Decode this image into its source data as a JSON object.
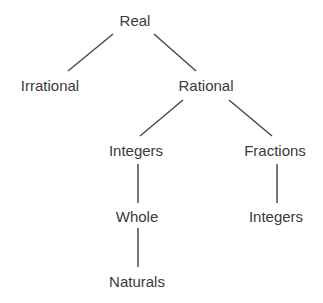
{
  "diagram": {
    "type": "tree",
    "line_color": "#4a4a4a",
    "text_color": "#3a3a3a",
    "nodes": {
      "real": {
        "label": "Real",
        "x": 135,
        "y": 20
      },
      "irrational": {
        "label": "Irrational",
        "x": 50,
        "y": 85
      },
      "rational": {
        "label": "Rational",
        "x": 206,
        "y": 85
      },
      "integers": {
        "label": "Integers",
        "x": 136,
        "y": 150
      },
      "fractions": {
        "label": "Fractions",
        "x": 275,
        "y": 150
      },
      "whole": {
        "label": "Whole",
        "x": 137,
        "y": 216
      },
      "fraction_integers": {
        "label": "Integers",
        "x": 276,
        "y": 216
      },
      "naturals": {
        "label": "Naturals",
        "x": 137,
        "y": 281
      }
    },
    "edges": [
      {
        "from": "real",
        "to": "irrational",
        "x1": 113,
        "y1": 34,
        "x2": 68,
        "y2": 71
      },
      {
        "from": "real",
        "to": "rational",
        "x1": 154,
        "y1": 34,
        "x2": 196,
        "y2": 71
      },
      {
        "from": "rational",
        "to": "integers",
        "x1": 183,
        "y1": 100,
        "x2": 140,
        "y2": 136
      },
      {
        "from": "rational",
        "to": "fractions",
        "x1": 229,
        "y1": 100,
        "x2": 272,
        "y2": 136
      },
      {
        "from": "integers",
        "to": "whole",
        "x1": 138,
        "y1": 164,
        "x2": 138,
        "y2": 203
      },
      {
        "from": "whole",
        "to": "naturals",
        "x1": 138,
        "y1": 228,
        "x2": 138,
        "y2": 267
      },
      {
        "from": "fractions",
        "to": "fraction_integers",
        "x1": 277,
        "y1": 164,
        "x2": 277,
        "y2": 203
      }
    ]
  }
}
